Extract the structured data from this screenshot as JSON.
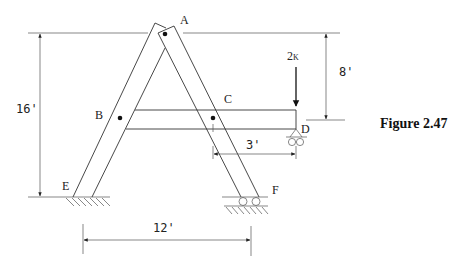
{
  "figure": {
    "caption": "Figure 2.47",
    "points": {
      "A": "A",
      "B": "B",
      "C": "C",
      "D": "D",
      "E": "E",
      "F": "F"
    },
    "load": {
      "label": "2K",
      "value_main": "2",
      "value_unit": "K",
      "direction": "down",
      "applied_at": "D"
    },
    "dimensions": {
      "height_total": "16'",
      "height_upper": "8'",
      "overhang": "3'",
      "base_span": "12'"
    },
    "supports": {
      "E": "fixed",
      "F": "roller",
      "D": "roller"
    }
  }
}
